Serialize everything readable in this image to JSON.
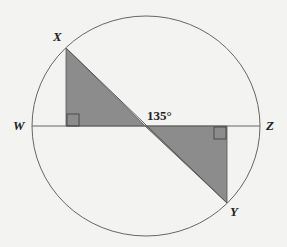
{
  "diagram": {
    "type": "geometry",
    "labels": {
      "X": "X",
      "Y": "Y",
      "W": "W",
      "Z": "Z"
    },
    "angle_label": "135°",
    "colors": {
      "background": "#f3f3f1",
      "shade": "#8c8c8c",
      "stroke": "#555555"
    }
  }
}
